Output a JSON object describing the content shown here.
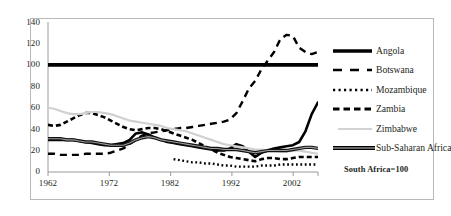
{
  "figure": {
    "note": "South Africa=100",
    "caption": ""
  },
  "chart_data": {
    "type": "line",
    "title": "",
    "xlabel": "",
    "ylabel": "",
    "xlim": [
      1962,
      2005
    ],
    "ylim": [
      0,
      140
    ],
    "grid": false,
    "legend_position": "right",
    "x_ticks": [
      "1962",
      "1972",
      "1982",
      "1992",
      "2002"
    ],
    "y_ticks": [
      "0",
      "20",
      "40",
      "60",
      "80",
      "100",
      "120",
      "140"
    ],
    "annotation": "South Africa=100",
    "x": [
      1962,
      1963,
      1964,
      1965,
      1966,
      1967,
      1968,
      1969,
      1970,
      1971,
      1972,
      1973,
      1974,
      1975,
      1976,
      1977,
      1978,
      1979,
      1980,
      1981,
      1982,
      1983,
      1984,
      1985,
      1986,
      1987,
      1988,
      1989,
      1990,
      1991,
      1992,
      1993,
      1994,
      1995,
      1996,
      1997,
      1998,
      1999,
      2000,
      2001,
      2002,
      2003,
      2004,
      2005
    ],
    "series": [
      {
        "name": "Angola",
        "style": "solid-thick",
        "color": "#000000",
        "values": [
          30,
          30,
          30,
          30,
          30,
          29,
          28,
          27,
          26,
          25,
          25,
          26,
          27,
          30,
          36,
          37,
          35,
          32,
          30,
          28,
          27,
          26,
          25,
          24,
          23,
          22,
          21,
          20,
          20,
          22,
          26,
          24,
          19,
          14,
          18,
          20,
          22,
          23,
          24,
          25,
          28,
          38,
          54,
          65
        ]
      },
      {
        "name": "Botswana",
        "style": "dashed-long",
        "color": "#000000",
        "values": [
          17,
          17,
          16,
          16,
          16,
          16,
          17,
          17,
          17,
          17,
          18,
          20,
          22,
          26,
          30,
          34,
          36,
          37,
          38,
          39,
          40,
          41,
          41,
          42,
          43,
          44,
          45,
          46,
          47,
          49,
          55,
          66,
          78,
          85,
          96,
          104,
          112,
          124,
          128,
          127,
          116,
          112,
          110,
          112
        ]
      },
      {
        "name": "Mozambique",
        "style": "dotted",
        "color": "#000000",
        "values": [
          null,
          null,
          null,
          null,
          null,
          null,
          null,
          null,
          null,
          null,
          null,
          null,
          null,
          null,
          null,
          null,
          null,
          null,
          null,
          null,
          12,
          11,
          10,
          9,
          9,
          8,
          8,
          7,
          6,
          6,
          5,
          5,
          5,
          5,
          6,
          6,
          6,
          7,
          7,
          7,
          7,
          7,
          7,
          7
        ]
      },
      {
        "name": "Zambia",
        "style": "dashed-short",
        "color": "#000000",
        "values": [
          44,
          43,
          44,
          47,
          50,
          53,
          55,
          55,
          53,
          51,
          48,
          45,
          42,
          40,
          39,
          40,
          41,
          41,
          40,
          38,
          36,
          34,
          32,
          30,
          27,
          24,
          21,
          18,
          16,
          14,
          13,
          12,
          11,
          10,
          12,
          13,
          13,
          12,
          12,
          13,
          14,
          14,
          14,
          14
        ]
      },
      {
        "name": "Zimbabwe",
        "style": "solid-light",
        "color": "#cccccc",
        "values": [
          60,
          59,
          57,
          55,
          54,
          54,
          55,
          56,
          56,
          55,
          54,
          52,
          50,
          48,
          47,
          46,
          45,
          44,
          43,
          41,
          40,
          39,
          38,
          36,
          34,
          32,
          30,
          28,
          26,
          25,
          24,
          23,
          22,
          21,
          21,
          20,
          20,
          19,
          19,
          20,
          20,
          19,
          18,
          17
        ]
      },
      {
        "name": "Sub-Saharan Africa",
        "style": "solid-medium",
        "color": "#3a3a3a",
        "values": [
          31,
          31,
          31,
          30,
          30,
          29,
          28,
          28,
          27,
          26,
          25,
          25,
          25,
          27,
          30,
          32,
          33,
          32,
          30,
          29,
          28,
          27,
          26,
          25,
          24,
          23,
          22,
          22,
          21,
          21,
          21,
          20,
          19,
          18,
          19,
          20,
          20,
          20,
          20,
          21,
          22,
          23,
          23,
          22
        ]
      },
      {
        "name": "South Africa reference",
        "style": "solid-extrathick",
        "color": "#000000",
        "values": [
          100,
          100,
          100,
          100,
          100,
          100,
          100,
          100,
          100,
          100,
          100,
          100,
          100,
          100,
          100,
          100,
          100,
          100,
          100,
          100,
          100,
          100,
          100,
          100,
          100,
          100,
          100,
          100,
          100,
          100,
          100,
          100,
          100,
          100,
          100,
          100,
          100,
          100,
          100,
          100,
          100,
          100,
          100,
          100
        ]
      }
    ]
  },
  "legend": {
    "items": [
      {
        "label": "Angola",
        "symbol": "solid-thick-line"
      },
      {
        "label": "Botswana",
        "symbol": "long-dash-line"
      },
      {
        "label": "Mozambique",
        "symbol": "dotted-line"
      },
      {
        "label": "Zambia",
        "symbol": "short-dash-line"
      },
      {
        "label": "Zimbabwe",
        "symbol": "light-gray-line"
      },
      {
        "label": "Sub-Saharan Africa",
        "symbol": "thick-line"
      }
    ]
  },
  "axes": {
    "y_labels": [
      "140",
      "120",
      "100",
      "80",
      "60",
      "40",
      "20",
      "0"
    ],
    "x_labels": [
      "1962",
      "1972",
      "1982",
      "1992",
      "2002"
    ]
  }
}
